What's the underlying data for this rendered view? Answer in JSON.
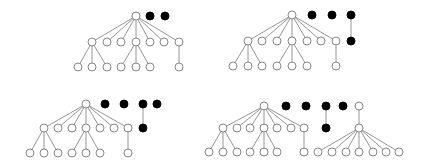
{
  "diagram": {
    "node_radius": 4,
    "colors": {
      "background": "#ffffff",
      "edge": "#8a8a8a",
      "white_node_stroke": "#7a7a7a",
      "black_node": "#000000"
    },
    "panels": [
      {
        "name": "panel-top-left",
        "nodes": [
          [
            136,
            16,
            "white"
          ],
          [
            150,
            16,
            "black"
          ],
          [
            165,
            16,
            "black"
          ],
          [
            92,
            42,
            "white"
          ],
          [
            107,
            42,
            "white"
          ],
          [
            121,
            42,
            "white"
          ],
          [
            136,
            42,
            "white"
          ],
          [
            150,
            42,
            "white"
          ],
          [
            164,
            42,
            "white"
          ],
          [
            179,
            42,
            "white"
          ],
          [
            78,
            67,
            "white"
          ],
          [
            92,
            67,
            "white"
          ],
          [
            107,
            67,
            "white"
          ],
          [
            121,
            67,
            "white"
          ],
          [
            136,
            67,
            "white"
          ],
          [
            150,
            67,
            "white"
          ],
          [
            179,
            67,
            "white"
          ]
        ],
        "edges": [
          [
            0,
            3
          ],
          [
            0,
            4
          ],
          [
            0,
            5
          ],
          [
            0,
            6
          ],
          [
            0,
            7
          ],
          [
            0,
            8
          ],
          [
            0,
            9
          ],
          [
            3,
            10
          ],
          [
            3,
            11
          ],
          [
            3,
            12
          ],
          [
            6,
            13
          ],
          [
            6,
            14
          ],
          [
            6,
            15
          ],
          [
            9,
            16
          ]
        ]
      },
      {
        "name": "panel-top-right",
        "nodes": [
          [
            292,
            15,
            "white"
          ],
          [
            312,
            15,
            "black"
          ],
          [
            332,
            15,
            "black"
          ],
          [
            351,
            15,
            "black"
          ],
          [
            351,
            41,
            "black"
          ],
          [
            248,
            41,
            "white"
          ],
          [
            262,
            41,
            "white"
          ],
          [
            277,
            41,
            "white"
          ],
          [
            292,
            41,
            "white"
          ],
          [
            307,
            41,
            "white"
          ],
          [
            321,
            41,
            "white"
          ],
          [
            336,
            41,
            "white"
          ],
          [
            233,
            66,
            "white"
          ],
          [
            248,
            66,
            "white"
          ],
          [
            262,
            66,
            "white"
          ],
          [
            277,
            66,
            "white"
          ],
          [
            292,
            66,
            "white"
          ],
          [
            307,
            66,
            "white"
          ],
          [
            336,
            66,
            "white"
          ]
        ],
        "edges": [
          [
            3,
            4
          ],
          [
            0,
            5
          ],
          [
            0,
            6
          ],
          [
            0,
            7
          ],
          [
            0,
            8
          ],
          [
            0,
            9
          ],
          [
            0,
            10
          ],
          [
            0,
            11
          ],
          [
            5,
            12
          ],
          [
            5,
            13
          ],
          [
            5,
            14
          ],
          [
            8,
            15
          ],
          [
            8,
            16
          ],
          [
            8,
            17
          ],
          [
            11,
            18
          ]
        ]
      },
      {
        "name": "panel-bottom-left",
        "nodes": [
          [
            86,
            104,
            "white"
          ],
          [
            105,
            104,
            "black"
          ],
          [
            124,
            104,
            "black"
          ],
          [
            143,
            104,
            "black"
          ],
          [
            157,
            104,
            "black"
          ],
          [
            143,
            128,
            "black"
          ],
          [
            44,
            128,
            "white"
          ],
          [
            58,
            128,
            "white"
          ],
          [
            72,
            128,
            "white"
          ],
          [
            86,
            128,
            "white"
          ],
          [
            100,
            128,
            "white"
          ],
          [
            114,
            128,
            "white"
          ],
          [
            128,
            128,
            "white"
          ],
          [
            30,
            153,
            "white"
          ],
          [
            44,
            153,
            "white"
          ],
          [
            58,
            153,
            "white"
          ],
          [
            72,
            153,
            "white"
          ],
          [
            86,
            153,
            "white"
          ],
          [
            100,
            153,
            "white"
          ],
          [
            128,
            153,
            "white"
          ]
        ],
        "edges": [
          [
            3,
            5
          ],
          [
            0,
            6
          ],
          [
            0,
            7
          ],
          [
            0,
            8
          ],
          [
            0,
            9
          ],
          [
            0,
            10
          ],
          [
            0,
            11
          ],
          [
            0,
            12
          ],
          [
            6,
            13
          ],
          [
            6,
            14
          ],
          [
            6,
            15
          ],
          [
            9,
            16
          ],
          [
            9,
            17
          ],
          [
            9,
            18
          ],
          [
            12,
            19
          ]
        ]
      },
      {
        "name": "panel-bottom-right",
        "nodes": [
          [
            264,
            106,
            "white"
          ],
          [
            286,
            106,
            "black"
          ],
          [
            306,
            106,
            "black"
          ],
          [
            326,
            106,
            "black"
          ],
          [
            343,
            106,
            "black"
          ],
          [
            326,
            128,
            "black"
          ],
          [
            359,
            106,
            "white"
          ],
          [
            359,
            128,
            "white"
          ],
          [
            223,
            128,
            "white"
          ],
          [
            237,
            128,
            "white"
          ],
          [
            250,
            128,
            "white"
          ],
          [
            264,
            128,
            "white"
          ],
          [
            277,
            128,
            "white"
          ],
          [
            291,
            128,
            "white"
          ],
          [
            304,
            128,
            "white"
          ],
          [
            209,
            152,
            "white"
          ],
          [
            223,
            152,
            "white"
          ],
          [
            237,
            152,
            "white"
          ],
          [
            250,
            152,
            "white"
          ],
          [
            264,
            152,
            "white"
          ],
          [
            277,
            152,
            "white"
          ],
          [
            304,
            152,
            "white"
          ],
          [
            318,
            152,
            "white"
          ],
          [
            332,
            152,
            "white"
          ],
          [
            346,
            152,
            "white"
          ],
          [
            359,
            152,
            "white"
          ],
          [
            373,
            152,
            "white"
          ],
          [
            386,
            152,
            "white"
          ],
          [
            399,
            152,
            "white"
          ]
        ],
        "edges": [
          [
            3,
            5
          ],
          [
            6,
            7
          ],
          [
            7,
            22
          ],
          [
            7,
            23
          ],
          [
            7,
            24
          ],
          [
            7,
            25
          ],
          [
            7,
            26
          ],
          [
            7,
            27
          ],
          [
            7,
            28
          ],
          [
            0,
            8
          ],
          [
            0,
            9
          ],
          [
            0,
            10
          ],
          [
            0,
            11
          ],
          [
            0,
            12
          ],
          [
            0,
            13
          ],
          [
            0,
            14
          ],
          [
            8,
            15
          ],
          [
            8,
            16
          ],
          [
            8,
            17
          ],
          [
            11,
            18
          ],
          [
            11,
            19
          ],
          [
            11,
            20
          ],
          [
            14,
            21
          ]
        ]
      }
    ]
  }
}
